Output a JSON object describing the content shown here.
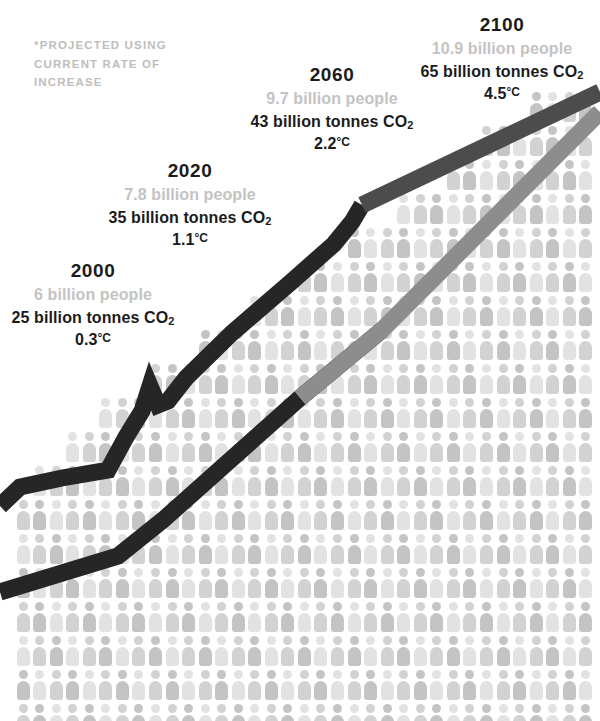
{
  "figure": {
    "footnote": "*Projected using\ncurrent rate of\nincrease",
    "icon_name": "person-pictogram"
  },
  "colors": {
    "background": "#ffffff",
    "people_light": "#e2e2e2",
    "people_mid": "#d2d2d2",
    "people_dark": "#c4c4c4",
    "text_dark": "#1b1b1b",
    "text_muted": "#c3c3c3",
    "line_historic": "#262626",
    "line_co2_projected": "#4c4c4c",
    "line_population_projected": "#8d8d8d"
  },
  "callouts": [
    {
      "id": "2000",
      "year": "2000",
      "people": "6 billion people",
      "co2_value": "25 billion tonnes CO",
      "co2_sub": "2",
      "temp": "0.3",
      "temp_unit": "°C"
    },
    {
      "id": "2020",
      "year": "2020",
      "people": "7.8 billion people",
      "co2_value": "35 billion tonnes CO",
      "co2_sub": "2",
      "temp": "1.1",
      "temp_unit": "°C"
    },
    {
      "id": "2060",
      "year": "2060",
      "people": "9.7 billion people",
      "co2_value": "43 billion tonnes CO",
      "co2_sub": "2",
      "temp": "2.2",
      "temp_unit": "°C"
    },
    {
      "id": "2100",
      "year": "2100",
      "people": "10.9 billion people",
      "co2_value": "65 billion tonnes CO",
      "co2_sub": "2",
      "temp": "4.5",
      "temp_unit": "°C"
    }
  ],
  "chart_data": {
    "type": "line",
    "subtitle": "*Projected using current rate of increase",
    "xlabel": "Year",
    "ylabel": "",
    "x": [
      2000,
      2020,
      2060,
      2100
    ],
    "grid": false,
    "legend_position": "none",
    "annotations": [
      "2000 — 6 billion people, 25 billion tonnes CO2, 0.3°C",
      "2020 — 7.8 billion people, 35 billion tonnes CO2, 1.1°C",
      "2060 — 9.7 billion people, 43 billion tonnes CO2, 2.2°C",
      "2100 — 10.9 billion people, 65 billion tonnes CO2, 4.5°C"
    ],
    "series": [
      {
        "name": "CO2 emissions (billion tonnes)",
        "values": [
          25,
          35,
          43,
          65
        ],
        "units": "billion tonnes",
        "color": "#262626",
        "projected_from": 2020
      },
      {
        "name": "World population (billions)",
        "values": [
          6,
          7.8,
          9.7,
          10.9
        ],
        "units": "billion people",
        "color": "#262626",
        "projected_from": 2020
      },
      {
        "name": "Temperature rise (°C)",
        "values": [
          0.3,
          1.1,
          2.2,
          4.5
        ],
        "units": "°C",
        "color": "#1b1b1b",
        "projected_from": 2020
      }
    ],
    "pictogram": {
      "symbol": "person-pictogram",
      "meaning": "each figure represents a share of world population",
      "note": "population bar-field grows as a staircase from lower-left to upper-right"
    }
  }
}
